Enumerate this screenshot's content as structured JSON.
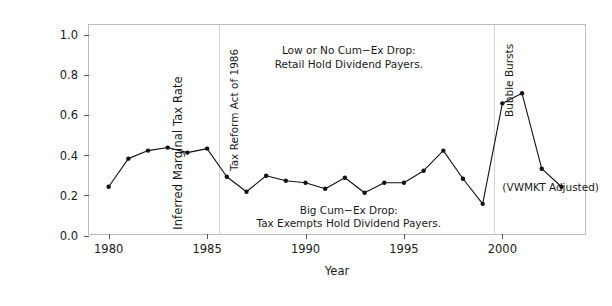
{
  "chart_data": {
    "type": "line",
    "title": "",
    "xlabel": "Year",
    "ylabel": "Inferred Marginal Tax Rate",
    "xlim": [
      1979.0,
      2004.3
    ],
    "ylim": [
      0.0,
      1.05
    ],
    "grid": false,
    "legend": "none",
    "xticks": [
      1980,
      1985,
      1990,
      1995,
      2000
    ],
    "xtick_labels": [
      "1980",
      "1985",
      "1990",
      "1995",
      "2000"
    ],
    "yticks": [
      0.0,
      0.2,
      0.4,
      0.6,
      0.8,
      1.0
    ],
    "ytick_labels": [
      "0.0",
      "0.2",
      "0.4",
      "0.6",
      "0.8",
      "1.0"
    ],
    "x": [
      1980,
      1981,
      1982,
      1983,
      1984,
      1985,
      1986,
      1987,
      1988,
      1989,
      1990,
      1991,
      1992,
      1993,
      1994,
      1995,
      1996,
      1997,
      1998,
      1999,
      2000,
      2001,
      2002,
      2003
    ],
    "values": [
      0.245,
      0.385,
      0.425,
      0.44,
      0.415,
      0.435,
      0.295,
      0.22,
      0.3,
      0.275,
      0.265,
      0.235,
      0.29,
      0.215,
      0.265,
      0.265,
      0.325,
      0.425,
      0.285,
      0.16,
      0.66,
      0.71,
      0.335,
      0.245
    ],
    "series": [
      {
        "name": "Inferred Marginal Tax Rate",
        "color": "#111111",
        "marker": "circle",
        "values": [
          0.245,
          0.385,
          0.425,
          0.44,
          0.415,
          0.435,
          0.295,
          0.22,
          0.3,
          0.275,
          0.265,
          0.235,
          0.29,
          0.215,
          0.265,
          0.265,
          0.325,
          0.425,
          0.285,
          0.16,
          0.66,
          0.71,
          0.335,
          0.245
        ]
      }
    ],
    "vlines": [
      {
        "name": "tax-reform-act-1986",
        "x": 1985.6,
        "label": "Tax Reform Act of 1986",
        "color": "#d2d2d2"
      },
      {
        "name": "bubble-bursts",
        "x": 1999.6,
        "label": "Bubble Bursts",
        "color": "#d2d2d2"
      }
    ],
    "annotations": [
      {
        "name": "low-drop-annotation",
        "x": 1992.2,
        "y": 0.955,
        "align": "center",
        "lines": [
          "Low or No Cum−Ex Drop:",
          "Retail Hold Dividend Payers."
        ]
      },
      {
        "name": "big-drop-annotation",
        "x": 1992.2,
        "y": 0.16,
        "align": "center",
        "lines": [
          "Big Cum−Ex Drop:",
          "Tax Exempts Hold Dividend Payers."
        ]
      },
      {
        "name": "vwmkt-adjusted-annotation",
        "x": 2000.0,
        "y": 0.275,
        "align": "left",
        "lines": [
          "(VWMKT Adjusted)"
        ]
      }
    ]
  }
}
